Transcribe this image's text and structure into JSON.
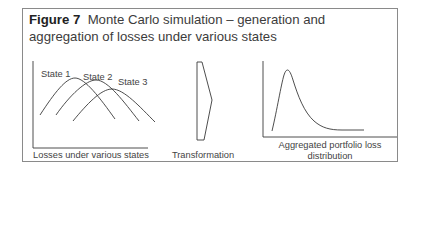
{
  "figure": {
    "number_label": "Figure 7",
    "title": "Monte Carlo simulation – generation and aggregation of losses under various states"
  },
  "panels": {
    "losses": {
      "caption": "Losses under various states",
      "state_labels": [
        "State 1",
        "State 2",
        "State 3"
      ]
    },
    "transformation": {
      "caption": "Transformation"
    },
    "aggregated": {
      "caption_line1": "Aggregated portfolio loss",
      "caption_line2": "distribution"
    }
  },
  "colors": {
    "line": "#3a3a3a",
    "frame": "#8a8a8a",
    "text": "#444444"
  }
}
